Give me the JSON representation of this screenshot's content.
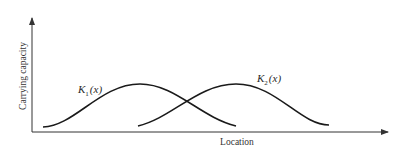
{
  "diagram": {
    "y_axis_label": "Carrying capacity",
    "x_axis_label": "Location",
    "curves": [
      {
        "name": "K1",
        "label_main": "K",
        "label_sub": "1",
        "label_arg": "(x)"
      },
      {
        "name": "K2",
        "label_main": "K",
        "label_sub": "2",
        "label_arg": "(x)"
      }
    ],
    "colors": {
      "stroke": "#1a1a1a",
      "axis": "#333333",
      "background": "#ffffff"
    }
  }
}
